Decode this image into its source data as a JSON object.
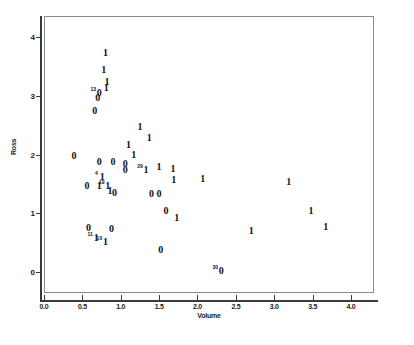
{
  "chart_data": {
    "type": "scatter",
    "title": "",
    "xlabel": "Volume",
    "ylabel": "Ross",
    "xlim": [
      0.0,
      4.3
    ],
    "ylim": [
      -0.35,
      4.35
    ],
    "grid": false,
    "legend": null,
    "xticks": [
      "0.0",
      "0.5",
      "1.0",
      "1.5",
      "2.0",
      "2.5",
      "3.0",
      "3.5",
      "4.0"
    ],
    "xtick_values": [
      0.0,
      0.5,
      1.0,
      1.5,
      2.0,
      2.5,
      3.0,
      3.5,
      4.0
    ],
    "yticks": [
      "0",
      "1",
      "2",
      "3",
      "4"
    ],
    "ytick_values": [
      0,
      1,
      2,
      3,
      4
    ],
    "marker_note": "Each point is plotted as its group-code digit: '1' or '0'. Small superscript numerals are SPSS case-number labels for outliers.",
    "points": [
      {
        "x": 0.8,
        "y": 3.72,
        "marker": "1",
        "label": ""
      },
      {
        "x": 0.78,
        "y": 3.43,
        "marker": "1",
        "label": ""
      },
      {
        "x": 0.82,
        "y": 3.23,
        "marker": "1",
        "label": ""
      },
      {
        "x": 0.81,
        "y": 3.12,
        "marker": "1",
        "label": ""
      },
      {
        "x": 0.72,
        "y": 3.05,
        "marker": "0",
        "label": "13"
      },
      {
        "x": 0.7,
        "y": 2.96,
        "marker": "0",
        "label": ""
      },
      {
        "x": 0.66,
        "y": 2.73,
        "marker": "0",
        "label": ""
      },
      {
        "x": 1.25,
        "y": 2.47,
        "marker": "1",
        "label": ""
      },
      {
        "x": 1.37,
        "y": 2.28,
        "marker": "1",
        "label": ""
      },
      {
        "x": 1.1,
        "y": 2.16,
        "marker": "1",
        "label": ""
      },
      {
        "x": 0.39,
        "y": 1.97,
        "marker": "0",
        "label": ""
      },
      {
        "x": 1.17,
        "y": 1.99,
        "marker": "1",
        "label": ""
      },
      {
        "x": 0.72,
        "y": 1.88,
        "marker": "0",
        "label": ""
      },
      {
        "x": 0.9,
        "y": 1.88,
        "marker": "0",
        "label": ""
      },
      {
        "x": 1.06,
        "y": 1.84,
        "marker": "0",
        "label": ""
      },
      {
        "x": 1.06,
        "y": 1.73,
        "marker": "0",
        "label": ""
      },
      {
        "x": 1.33,
        "y": 1.73,
        "marker": "1",
        "label": "29"
      },
      {
        "x": 1.5,
        "y": 1.78,
        "marker": "1",
        "label": ""
      },
      {
        "x": 1.68,
        "y": 1.75,
        "marker": "1",
        "label": ""
      },
      {
        "x": 0.76,
        "y": 1.62,
        "marker": "1",
        "label": "4"
      },
      {
        "x": 0.56,
        "y": 1.47,
        "marker": "0",
        "label": ""
      },
      {
        "x": 0.72,
        "y": 1.46,
        "marker": "1",
        "label": ""
      },
      {
        "x": 0.83,
        "y": 1.46,
        "marker": "1",
        "label": "19"
      },
      {
        "x": 0.86,
        "y": 1.38,
        "marker": "1",
        "label": ""
      },
      {
        "x": 0.92,
        "y": 1.34,
        "marker": "0",
        "label": ""
      },
      {
        "x": 1.4,
        "y": 1.33,
        "marker": "0",
        "label": ""
      },
      {
        "x": 1.5,
        "y": 1.33,
        "marker": "0",
        "label": ""
      },
      {
        "x": 1.69,
        "y": 1.57,
        "marker": "1",
        "label": ""
      },
      {
        "x": 2.07,
        "y": 1.58,
        "marker": "1",
        "label": ""
      },
      {
        "x": 3.19,
        "y": 1.53,
        "marker": "1",
        "label": ""
      },
      {
        "x": 1.59,
        "y": 1.04,
        "marker": "0",
        "label": ""
      },
      {
        "x": 1.73,
        "y": 0.92,
        "marker": "1",
        "label": ""
      },
      {
        "x": 3.48,
        "y": 1.04,
        "marker": "1",
        "label": ""
      },
      {
        "x": 0.58,
        "y": 0.75,
        "marker": "0",
        "label": ""
      },
      {
        "x": 0.88,
        "y": 0.74,
        "marker": "0",
        "label": ""
      },
      {
        "x": 2.7,
        "y": 0.71,
        "marker": "1",
        "label": ""
      },
      {
        "x": 3.67,
        "y": 0.77,
        "marker": "1",
        "label": ""
      },
      {
        "x": 0.68,
        "y": 0.59,
        "marker": "1",
        "label": "11"
      },
      {
        "x": 0.8,
        "y": 0.51,
        "marker": "1",
        "label": "10"
      },
      {
        "x": 1.52,
        "y": 0.38,
        "marker": "0",
        "label": ""
      },
      {
        "x": 2.31,
        "y": 0.02,
        "marker": "0",
        "label": "30"
      }
    ]
  }
}
